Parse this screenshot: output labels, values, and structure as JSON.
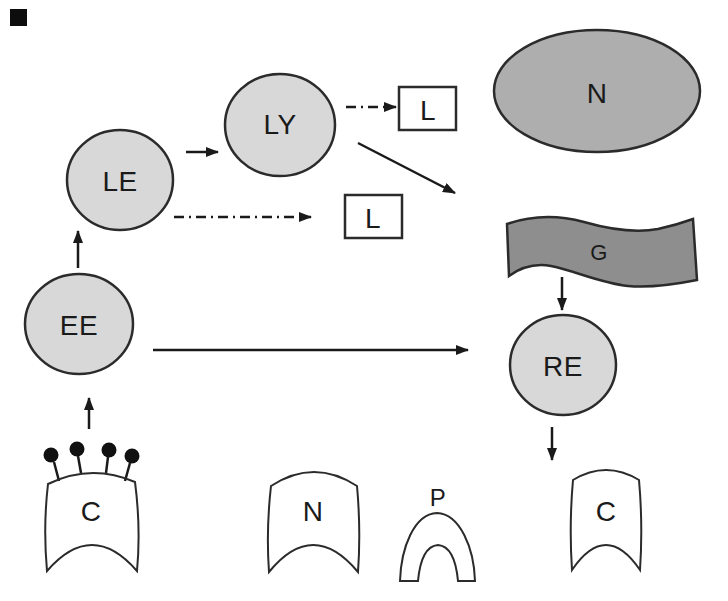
{
  "diagram": {
    "kind": "membrane-trafficking-pathway",
    "background": "#ffffff"
  },
  "colors": {
    "endosome_fill": "#d8d8d8",
    "nucleus_fill": "#aeaeae",
    "golgi_fill": "#8e8e8e",
    "outline": "#2b2b2b",
    "arrow": "#1a1a1a",
    "label": "#1a1a1a",
    "artifact": "#0d0d0d",
    "white_fill": "#ffffff"
  },
  "nodes": {
    "early_endosome": {
      "label": "EE",
      "shape": "circle"
    },
    "late_endosome": {
      "label": "LE",
      "shape": "circle"
    },
    "lysosome_vesicle": {
      "label": "LY",
      "shape": "circle"
    },
    "recycling_endosome": {
      "label": "RE",
      "shape": "circle"
    },
    "nucleus": {
      "label": "N",
      "shape": "ellipse"
    },
    "golgi": {
      "label": "G",
      "shape": "wavy-band"
    },
    "l_box_top": {
      "label": "L",
      "shape": "rect"
    },
    "l_box_bottom": {
      "label": "L",
      "shape": "rect"
    },
    "coated_pit_left": {
      "label": "C",
      "shape": "membrane-patch",
      "receptor_pins": 4
    },
    "membrane_n": {
      "label": "N",
      "shape": "membrane-patch"
    },
    "membrane_p": {
      "label": "P",
      "shape": "arch"
    },
    "membrane_c_right": {
      "label": "C",
      "shape": "membrane-patch"
    }
  },
  "edges": [
    {
      "from": "C (coated pit)",
      "to": "EE",
      "style": "solid"
    },
    {
      "from": "EE",
      "to": "LE",
      "style": "solid"
    },
    {
      "from": "LE",
      "to": "LY",
      "style": "solid"
    },
    {
      "from": "LY",
      "to": "L (top box)",
      "style": "dash-dot"
    },
    {
      "from": "LE",
      "to": "L (bottom box)",
      "style": "dash-dot"
    },
    {
      "from": "LY",
      "to": "Golgi region",
      "style": "solid-diagonal"
    },
    {
      "from": "EE",
      "to": "RE",
      "style": "solid"
    },
    {
      "from": "G",
      "to": "RE",
      "style": "solid"
    },
    {
      "from": "RE",
      "to": "C (right membrane)",
      "style": "solid"
    }
  ]
}
